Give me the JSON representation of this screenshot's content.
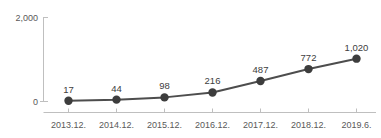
{
  "chart_data": {
    "type": "line",
    "title": "",
    "subtitle": "",
    "xlabel": "",
    "ylabel": "",
    "categories": [
      "2013.12.",
      "2014.12.",
      "2015.12.",
      "2016.12.",
      "2017.12.",
      "2018.12.",
      "2019.6."
    ],
    "values": [
      17,
      44,
      98,
      216,
      487,
      772,
      1020
    ],
    "value_labels": [
      "17",
      "44",
      "98",
      "216",
      "487",
      "772",
      "1,020"
    ],
    "ylim": [
      0,
      2000
    ],
    "y_ticks": [
      0,
      2000
    ],
    "y_tick_labels": [
      "0",
      "2,000"
    ],
    "grid": false,
    "legend": false,
    "legend_position": "none",
    "series": [
      {
        "name": "",
        "values": [
          17,
          44,
          98,
          216,
          487,
          772,
          1020
        ]
      }
    ]
  },
  "style": {
    "background_color": "#ffffff",
    "line_color": "#4d4d4d",
    "marker_color": "#3d3d3d",
    "axis_color": "#bfbfbf",
    "tick_label_color": "#595959",
    "value_label_color": "#404040"
  }
}
